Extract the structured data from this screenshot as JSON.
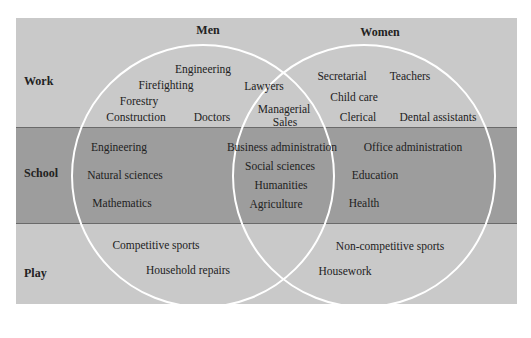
{
  "colors": {
    "background": "#c9c9c9",
    "school_band": "#9d9d9d",
    "band_border": "#6a6a6a",
    "circle_stroke": "#ffffff",
    "text": "#222222"
  },
  "headers": {
    "men": "Men",
    "women": "Women"
  },
  "rows": {
    "work": "Work",
    "school": "School",
    "play": "Play"
  },
  "sets": {
    "men": {
      "work": [
        "Engineering",
        "Firefighting",
        "Forestry",
        "Construction",
        "Doctors"
      ],
      "school": [
        "Engineering",
        "Natural sciences",
        "Mathematics"
      ],
      "play": [
        "Competitive sports",
        "Household repairs"
      ]
    },
    "both": {
      "work": [
        "Lawyers",
        "Managerial",
        "Sales"
      ],
      "school": [
        "Business administration",
        "Social sciences",
        "Humanities",
        "Agriculture"
      ]
    },
    "women": {
      "work": [
        "Secretarial",
        "Teachers",
        "Child care",
        "Clerical",
        "Dental assistants"
      ],
      "school": [
        "Office administration",
        "Education",
        "Health"
      ],
      "play": [
        "Non-competitive sports",
        "Housework"
      ]
    }
  }
}
